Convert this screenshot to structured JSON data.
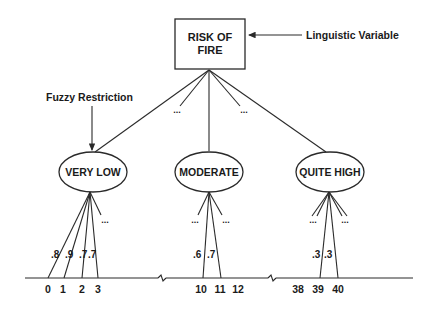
{
  "diagram": {
    "root": {
      "line1": "RISK OF",
      "line2": "FIRE"
    },
    "annotations": {
      "linguistic_variable": "Linguistic Variable",
      "fuzzy_restriction": "Fuzzy Restriction"
    },
    "ellipsis": "...",
    "terms": [
      {
        "label": "VERY LOW",
        "memberships": [
          ".8",
          ".9",
          ".7",
          ".7"
        ],
        "values": [
          "0",
          "1",
          "2",
          "3"
        ]
      },
      {
        "label": "MODERATE",
        "memberships": [
          ".6",
          ".7"
        ],
        "values": [
          "10",
          "11",
          "12"
        ]
      },
      {
        "label": "QUITE HIGH",
        "memberships": [
          ".3",
          ".3"
        ],
        "values": [
          "38",
          "39",
          "40"
        ]
      }
    ],
    "colors": {
      "ink": "#1a1a1a",
      "background": "#ffffff"
    }
  }
}
